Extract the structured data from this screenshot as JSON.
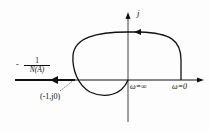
{
  "diagram": {
    "type": "nyquist-describing-function-plot",
    "axes": {
      "imag_label": "j"
    },
    "labels": {
      "neg_inv_df_sign": "-",
      "neg_inv_df_numerator": "1",
      "neg_inv_df_denominator": "N(A)",
      "critical_point": "(-1,j0)",
      "omega_infinity": "ω=∞",
      "omega_zero": "ω=0"
    },
    "colors": {
      "stroke": "#111111",
      "background": "#fdfdfd"
    }
  }
}
